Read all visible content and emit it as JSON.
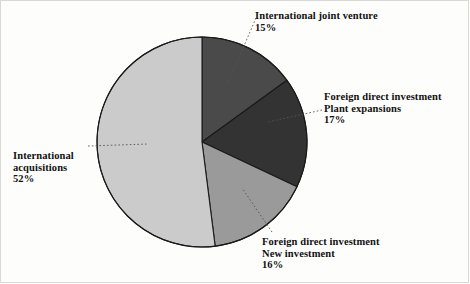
{
  "chart_data": {
    "type": "pie",
    "title": "",
    "subtitle": "",
    "xlabel": "",
    "ylabel": "",
    "legend_position": "none",
    "grid": false,
    "start_angle_deg": 0,
    "direction": "clockwise",
    "categories": [
      "International joint venture",
      "Foreign direct investment Plant expansions",
      "Foreign direct investment New investment",
      "International acquisitions"
    ],
    "values": [
      15,
      17,
      16,
      52
    ],
    "unit": "%",
    "slices": [
      {
        "id": "joint-venture",
        "lines": [
          "International joint venture"
        ],
        "value": 15,
        "value_label": "15%",
        "color": "#4a4a4a"
      },
      {
        "id": "plant-expansions",
        "lines": [
          "Foreign direct investment",
          "Plant expansions"
        ],
        "value": 17,
        "value_label": "17%",
        "color": "#333333"
      },
      {
        "id": "new-investment",
        "lines": [
          "Foreign direct investment",
          "New investment"
        ],
        "value": 16,
        "value_label": "16%",
        "color": "#9a9a9a"
      },
      {
        "id": "acquisitions",
        "lines": [
          "International",
          "acquisitions"
        ],
        "value": 52,
        "value_label": "52%",
        "color": "#cbcbcb"
      }
    ],
    "geometry": {
      "cx": 202,
      "cy": 142,
      "r": 105,
      "stroke": "#1a1a1a",
      "stroke_width": 1.1
    },
    "leaders": [
      {
        "id": "joint-venture",
        "x1": 256,
        "y1": 18,
        "x2": 228,
        "y2": 83
      },
      {
        "id": "plant-expansions",
        "x1": 322,
        "y1": 110,
        "x2": 268,
        "y2": 122
      },
      {
        "id": "acquisitions",
        "x1": 88,
        "y1": 146,
        "x2": 148,
        "y2": 144
      },
      {
        "id": "new-investment",
        "x1": 272,
        "y1": 232,
        "x2": 242,
        "y2": 188
      }
    ],
    "leader_style": {
      "color": "#555555",
      "dash": "1.6 2.2",
      "width": 0.9
    },
    "background": "#fdfdfb"
  },
  "labels": {
    "joint_venture": {
      "line1": "International joint venture",
      "line2": "15%"
    },
    "plant_expansions": {
      "line1": "Foreign direct investment",
      "line2": "Plant expansions",
      "line3": "17%"
    },
    "acquisitions": {
      "line1": "International",
      "line2": "acquisitions",
      "line3": "52%"
    },
    "new_investment": {
      "line1": "Foreign direct investment",
      "line2": "New investment",
      "line3": "16%"
    }
  }
}
